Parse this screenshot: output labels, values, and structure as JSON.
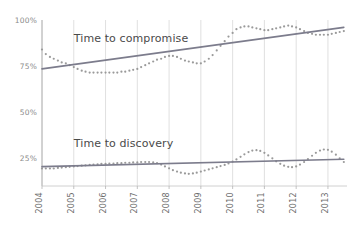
{
  "chart_data": {
    "type": "line",
    "title": "",
    "subtitle": "",
    "xlabel": "",
    "ylabel": "",
    "grid": "vertical-only",
    "legend_position": "inline-annotation",
    "xlim": [
      2004,
      2013.6
    ],
    "ylim": [
      10,
      100
    ],
    "x_tick_labels": [
      "2004",
      "2005",
      "2006",
      "2007",
      "2008",
      "2009",
      "2010",
      "2011",
      "2012",
      "2013"
    ],
    "x_tick_values": [
      2004,
      2005,
      2006,
      2007,
      2008,
      2009,
      2010,
      2011,
      2012,
      2013
    ],
    "y_tick_labels": [
      "100%",
      "75%",
      "50%",
      "25%"
    ],
    "y_tick_values": [
      100,
      75,
      50,
      25
    ],
    "annotations": [
      {
        "text": "Time to compromise",
        "x": 2005.0,
        "y": 88
      },
      {
        "text": "Time to discovery",
        "x": 2005.0,
        "y": 31
      }
    ],
    "series": [
      {
        "name": "Time to compromise",
        "style": "dotted",
        "color": "#9a9a9a",
        "x": [
          2004.0,
          2004.12,
          2004.25,
          2004.37,
          2004.5,
          2004.62,
          2004.75,
          2004.87,
          2005.0,
          2005.12,
          2005.25,
          2005.37,
          2005.5,
          2005.62,
          2005.75,
          2005.87,
          2006.0,
          2006.12,
          2006.25,
          2006.37,
          2006.5,
          2006.62,
          2006.75,
          2006.87,
          2007.0,
          2007.12,
          2007.25,
          2007.37,
          2007.5,
          2007.62,
          2007.75,
          2007.87,
          2008.0,
          2008.12,
          2008.25,
          2008.37,
          2008.5,
          2008.62,
          2008.75,
          2008.87,
          2009.0,
          2009.12,
          2009.25,
          2009.37,
          2009.5,
          2009.62,
          2009.75,
          2009.87,
          2010.0,
          2010.12,
          2010.25,
          2010.37,
          2010.5,
          2010.62,
          2010.75,
          2010.87,
          2011.0,
          2011.12,
          2011.25,
          2011.37,
          2011.5,
          2011.62,
          2011.75,
          2011.87,
          2012.0,
          2012.12,
          2012.25,
          2012.37,
          2012.5,
          2012.62,
          2012.75,
          2012.87,
          2013.0,
          2013.12,
          2013.25,
          2013.37,
          2013.5
        ],
        "y": [
          84.0,
          81.5,
          80.0,
          79.0,
          78.0,
          77.0,
          76.5,
          75.5,
          74.5,
          73.5,
          72.5,
          72.0,
          71.5,
          71.5,
          71.5,
          71.5,
          71.5,
          71.5,
          71.5,
          71.5,
          72.0,
          72.0,
          72.5,
          73.0,
          73.5,
          74.5,
          75.5,
          76.5,
          77.5,
          78.5,
          79.0,
          80.0,
          80.5,
          80.5,
          80.0,
          79.0,
          78.0,
          77.5,
          77.0,
          76.5,
          76.5,
          77.5,
          79.0,
          81.0,
          83.5,
          86.0,
          88.5,
          91.0,
          93.0,
          95.0,
          96.0,
          96.5,
          96.5,
          96.0,
          95.5,
          95.0,
          94.5,
          94.5,
          95.0,
          95.5,
          96.0,
          96.5,
          97.0,
          96.5,
          96.0,
          95.0,
          94.0,
          93.0,
          92.5,
          92.0,
          92.0,
          92.0,
          92.0,
          92.5,
          93.0,
          93.5,
          94.0
        ]
      },
      {
        "name": "Time to compromise trend",
        "style": "solid",
        "color": "#7c7c8c",
        "x": [
          2004.0,
          2013.5
        ],
        "y": [
          73.5,
          96.0
        ]
      },
      {
        "name": "Time to discovery",
        "style": "dotted",
        "color": "#9a9a9a",
        "x": [
          2004.0,
          2004.12,
          2004.25,
          2004.37,
          2004.5,
          2004.62,
          2004.75,
          2004.87,
          2005.0,
          2005.12,
          2005.25,
          2005.37,
          2005.5,
          2005.62,
          2005.75,
          2005.87,
          2006.0,
          2006.12,
          2006.25,
          2006.37,
          2006.5,
          2006.62,
          2006.75,
          2006.87,
          2007.0,
          2007.12,
          2007.25,
          2007.37,
          2007.5,
          2007.62,
          2007.75,
          2007.87,
          2008.0,
          2008.12,
          2008.25,
          2008.37,
          2008.5,
          2008.62,
          2008.75,
          2008.87,
          2009.0,
          2009.12,
          2009.25,
          2009.37,
          2009.5,
          2009.62,
          2009.75,
          2009.87,
          2010.0,
          2010.12,
          2010.25,
          2010.37,
          2010.5,
          2010.62,
          2010.75,
          2010.87,
          2011.0,
          2011.12,
          2011.25,
          2011.37,
          2011.5,
          2011.62,
          2011.75,
          2011.87,
          2012.0,
          2012.12,
          2012.25,
          2012.37,
          2012.5,
          2012.62,
          2012.75,
          2012.87,
          2013.0,
          2013.12,
          2013.25,
          2013.37,
          2013.5
        ],
        "y": [
          19.5,
          19.5,
          19.5,
          19.5,
          19.8,
          20.0,
          20.2,
          20.4,
          20.6,
          20.8,
          21.0,
          21.2,
          21.4,
          21.6,
          21.8,
          22.0,
          22.0,
          22.2,
          22.2,
          22.4,
          22.4,
          22.6,
          22.6,
          22.8,
          22.8,
          23.0,
          23.0,
          23.0,
          22.8,
          22.4,
          21.6,
          20.6,
          19.6,
          18.6,
          17.8,
          17.2,
          16.8,
          16.6,
          16.8,
          17.2,
          17.8,
          18.4,
          19.0,
          19.6,
          20.2,
          20.8,
          21.4,
          22.2,
          23.2,
          24.4,
          25.8,
          27.2,
          28.4,
          29.2,
          29.4,
          29.0,
          28.0,
          26.6,
          25.0,
          23.4,
          22.0,
          21.0,
          20.4,
          20.2,
          20.6,
          21.6,
          23.0,
          24.6,
          26.4,
          28.0,
          29.2,
          29.8,
          29.6,
          28.6,
          27.0,
          25.0,
          23.0
        ]
      },
      {
        "name": "Time to discovery trend",
        "style": "solid",
        "color": "#7c7c8c",
        "x": [
          2004.0,
          2013.5
        ],
        "y": [
          20.5,
          24.5
        ]
      }
    ]
  },
  "axis": {
    "y_axis_name": "percentage-axis",
    "x_axis_name": "year-axis"
  }
}
